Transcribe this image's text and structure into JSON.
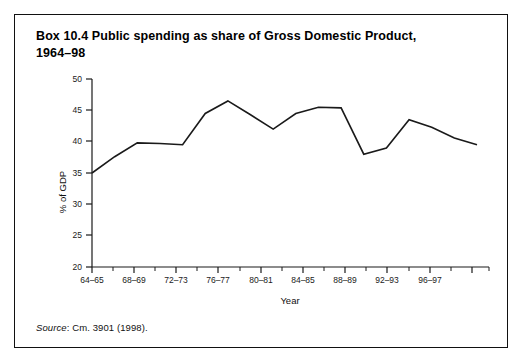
{
  "box": {
    "title_line1": "Box 10.4  Public spending as share of Gross Domestic Product,",
    "title_line2": "1964–98",
    "source_word": "Source",
    "source_rest": ": Cm. 3901 (1998).",
    "border_color": "#111111",
    "background_color": "#ffffff"
  },
  "chart_data": {
    "type": "line",
    "title": "Box 10.4  Public spending as share of Gross Domestic Product, 1964–98",
    "xlabel": "Year",
    "ylabel": "% of GDP",
    "ylim": [
      20,
      50
    ],
    "ytick_values": [
      20,
      25,
      30,
      35,
      40,
      45,
      50
    ],
    "ytick_labels": [
      "20",
      "25",
      "30",
      "35",
      "40",
      "45",
      "50"
    ],
    "grid": false,
    "legend": "none",
    "line_color": "#1a1a1a",
    "categories": [
      "64–65",
      "66–67",
      "68–69",
      "70–71",
      "72–73",
      "74–75",
      "76–77",
      "78–79",
      "80–81",
      "82–83",
      "84–85",
      "86–87",
      "88–89",
      "90–91",
      "92–93",
      "94–95",
      "96–97",
      "97–98"
    ],
    "xtick_labels": [
      "64–65",
      "68–69",
      "72–73",
      "76–77",
      "80–81",
      "84–85",
      "88–89",
      "92–93",
      "96–97"
    ],
    "values": [
      35.0,
      37.6,
      39.8,
      39.7,
      39.5,
      44.5,
      46.5,
      44.3,
      42.0,
      44.5,
      45.5,
      45.4,
      38.0,
      39.0,
      43.5,
      42.3,
      40.6,
      39.5
    ]
  }
}
